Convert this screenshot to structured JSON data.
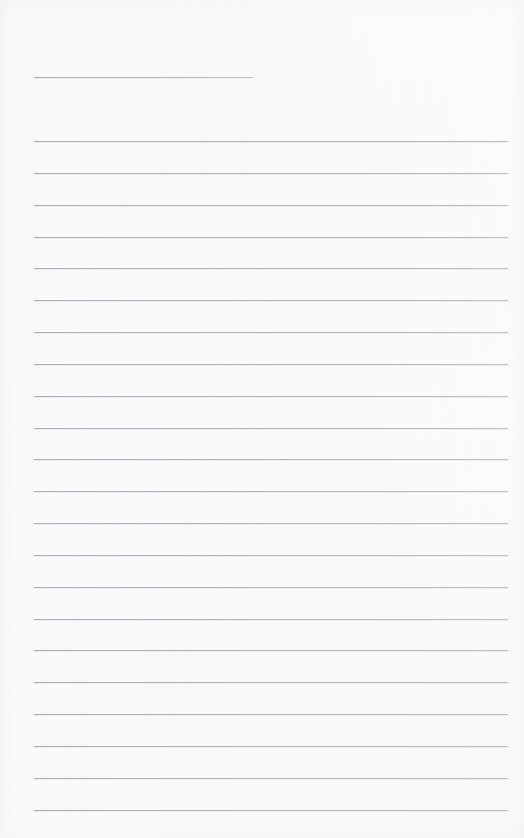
{
  "document": {
    "type": "lined-paper-scan",
    "title": "",
    "page_width": 524,
    "page_height": 838,
    "background_color": "#fcfcfc",
    "rule_color": "#b2b5ba",
    "rule_thickness_px": 1,
    "content_text": "",
    "is_blank": true
  },
  "layout": {
    "left_margin_px": 34,
    "right_edge_px": 508,
    "heading_rule_right_edge_px": 253,
    "first_body_rule_y_px": 141,
    "body_rule_spacing_px": 31.85,
    "body_rule_count": 22
  },
  "rules": {
    "heading": {
      "label": "heading-rule",
      "x": 34,
      "y": 77,
      "width": 219
    },
    "body": [
      {
        "label": "body-rule-1",
        "x": 34,
        "y": 141,
        "width": 474
      },
      {
        "label": "body-rule-2",
        "x": 34,
        "y": 173,
        "width": 474
      },
      {
        "label": "body-rule-3",
        "x": 34,
        "y": 205,
        "width": 474
      },
      {
        "label": "body-rule-4",
        "x": 34,
        "y": 237,
        "width": 474
      },
      {
        "label": "body-rule-5",
        "x": 34,
        "y": 268,
        "width": 474
      },
      {
        "label": "body-rule-6",
        "x": 34,
        "y": 300,
        "width": 474
      },
      {
        "label": "body-rule-7",
        "x": 34,
        "y": 332,
        "width": 474
      },
      {
        "label": "body-rule-8",
        "x": 34,
        "y": 364,
        "width": 474
      },
      {
        "label": "body-rule-9",
        "x": 34,
        "y": 396,
        "width": 474
      },
      {
        "label": "body-rule-10",
        "x": 34,
        "y": 428,
        "width": 474
      },
      {
        "label": "body-rule-11",
        "x": 34,
        "y": 459,
        "width": 474
      },
      {
        "label": "body-rule-12",
        "x": 34,
        "y": 491,
        "width": 474
      },
      {
        "label": "body-rule-13",
        "x": 34,
        "y": 523,
        "width": 474
      },
      {
        "label": "body-rule-14",
        "x": 34,
        "y": 555,
        "width": 474
      },
      {
        "label": "body-rule-15",
        "x": 34,
        "y": 587,
        "width": 474
      },
      {
        "label": "body-rule-16",
        "x": 34,
        "y": 619,
        "width": 474
      },
      {
        "label": "body-rule-17",
        "x": 34,
        "y": 650,
        "width": 474
      },
      {
        "label": "body-rule-18",
        "x": 34,
        "y": 682,
        "width": 474
      },
      {
        "label": "body-rule-19",
        "x": 34,
        "y": 714,
        "width": 474
      },
      {
        "label": "body-rule-20",
        "x": 34,
        "y": 746,
        "width": 474
      },
      {
        "label": "body-rule-21",
        "x": 34,
        "y": 778,
        "width": 474
      },
      {
        "label": "body-rule-22",
        "x": 34,
        "y": 810,
        "width": 474
      }
    ]
  }
}
